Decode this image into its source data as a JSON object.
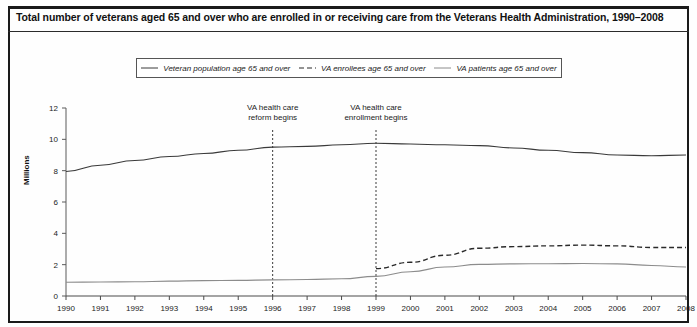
{
  "figure": {
    "title": "Total number of veterans aged 65 and over who are enrolled in or receiving care from the Veterans Health Administration, 1990–2008"
  },
  "legend": {
    "items": [
      {
        "label": "Veteran population age 65 and over",
        "style": "solid",
        "color": "#3a3a3a"
      },
      {
        "label": "VA enrollees age 65 and over",
        "style": "dashed",
        "color": "#2a2a2a"
      },
      {
        "label": "VA patients age 65 and over",
        "style": "solid",
        "color": "#8c8c8c"
      }
    ]
  },
  "chart_data": {
    "type": "line",
    "title": "Total number of veterans aged 65 and over who are enrolled in or receiving care from the Veterans Health Administration, 1990–2008",
    "xlabel": "",
    "ylabel": "Millions",
    "ylim": [
      0,
      12
    ],
    "yticks": [
      0,
      2,
      4,
      6,
      8,
      10,
      12
    ],
    "xlim": [
      1990,
      2008
    ],
    "x": [
      1990,
      1991,
      1992,
      1993,
      1994,
      1995,
      1996,
      1997,
      1998,
      1999,
      2000,
      2001,
      2002,
      2003,
      2004,
      2005,
      2006,
      2007,
      2008
    ],
    "xticks": [
      "1990",
      "1991",
      "1992",
      "1993",
      "1994",
      "1995",
      "1996",
      "1997",
      "1998",
      "1999",
      "2000",
      "2001",
      "2002",
      "2003",
      "2004",
      "2005",
      "2006",
      "2007",
      "2008"
    ],
    "grid": false,
    "legend_position": "top",
    "series": [
      {
        "name": "Veteran population age 65 and over",
        "style": "solid",
        "color": "#3a3a3a",
        "values": [
          7.95,
          8.35,
          8.65,
          8.9,
          9.1,
          9.3,
          9.5,
          9.55,
          9.65,
          9.75,
          9.7,
          9.65,
          9.6,
          9.45,
          9.3,
          9.15,
          9.0,
          8.95,
          9.0
        ]
      },
      {
        "name": "VA enrollees age 65 and over",
        "style": "dashed",
        "color": "#2a2a2a",
        "values": [
          null,
          null,
          null,
          null,
          null,
          null,
          null,
          null,
          null,
          1.75,
          2.15,
          2.6,
          3.05,
          3.15,
          3.2,
          3.25,
          3.2,
          3.1,
          3.1
        ]
      },
      {
        "name": "VA patients age 65 and over",
        "style": "solid",
        "color": "#8c8c8c",
        "values": [
          0.88,
          0.89,
          0.91,
          0.95,
          0.98,
          1.0,
          1.03,
          1.05,
          1.1,
          1.25,
          1.55,
          1.85,
          2.02,
          2.05,
          2.06,
          2.07,
          2.05,
          1.95,
          1.85
        ]
      }
    ],
    "annotations": [
      {
        "text_line1": "VA health care",
        "text_line2": "reform begins",
        "x": 1996
      },
      {
        "text_line1": "VA health care",
        "text_line2": "enrollment begins",
        "x": 1999
      }
    ]
  }
}
